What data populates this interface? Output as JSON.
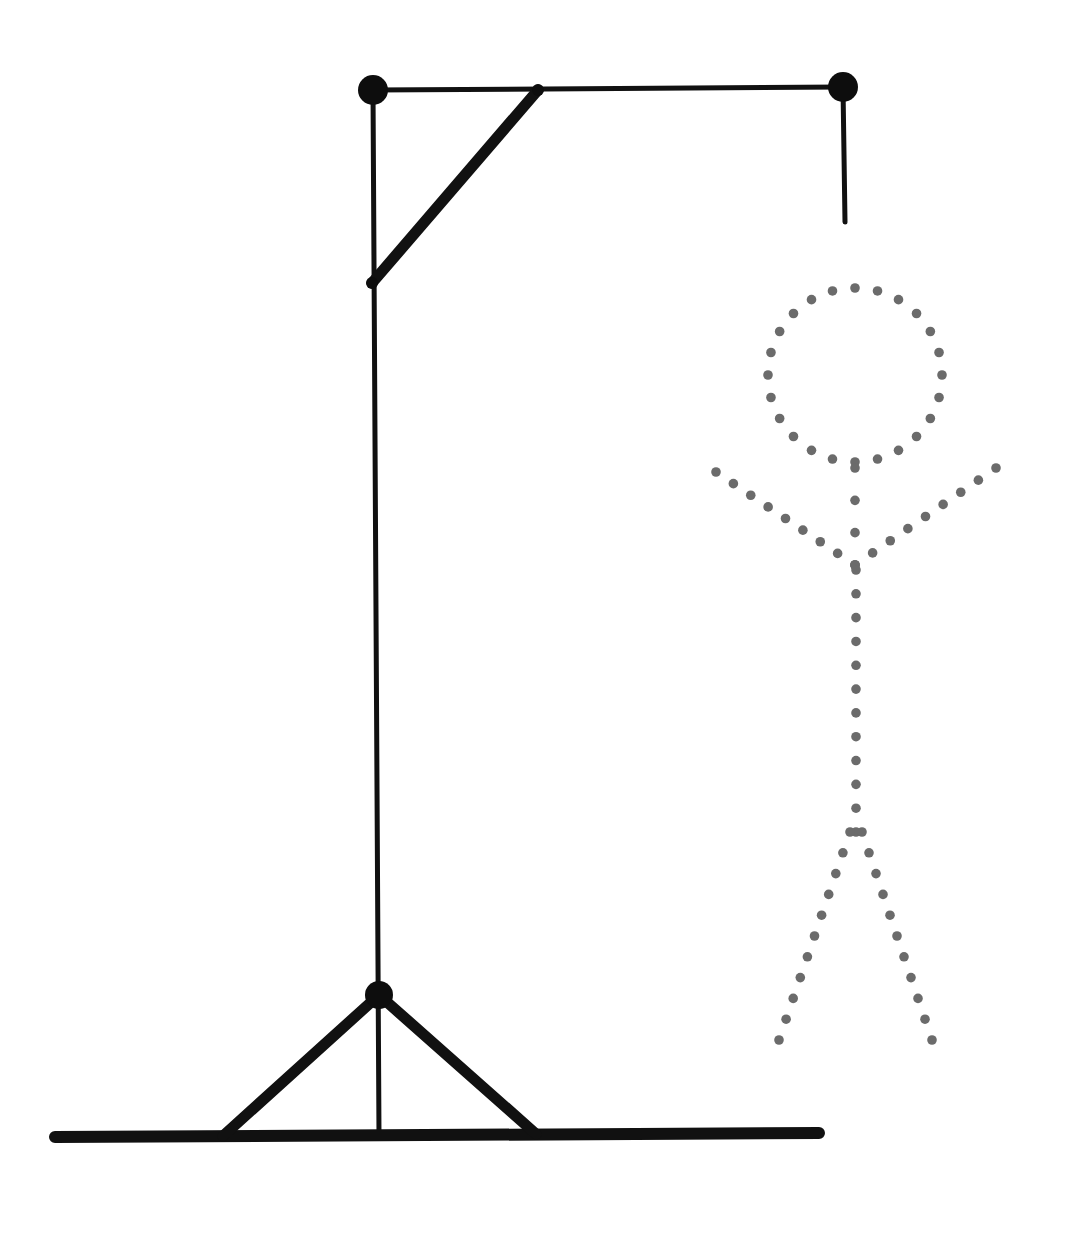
{
  "canvas": {
    "width": 1069,
    "height": 1237,
    "background": "#ffffff",
    "title": "Hangman Gallows With Dotted Stick Figure"
  },
  "palette": {
    "structure_stroke": "#111111",
    "thin_stroke": "#1a1a1a",
    "node_fill": "#0d0d0d",
    "dot_fill": "#6b6b6b"
  },
  "strokes": {
    "beam_thin": 5,
    "post_thin": 5,
    "brace_thick": 11,
    "ground_thick": 12,
    "rope_thin": 5
  },
  "gallows": {
    "name": "gallows-structure",
    "nodes": [
      {
        "name": "top-left-node",
        "cx": 373,
        "cy": 90,
        "r": 15
      },
      {
        "name": "top-right-node",
        "cx": 843,
        "cy": 87,
        "r": 15
      },
      {
        "name": "base-node",
        "cx": 379,
        "cy": 995,
        "r": 14
      },
      {
        "name": "brace-lower-joint",
        "cx": 372,
        "cy": 283,
        "r": 6
      },
      {
        "name": "brace-upper-joint",
        "cx": 538,
        "cy": 90,
        "r": 6
      }
    ],
    "members": [
      {
        "name": "top-beam",
        "x1": 373,
        "y1": 90,
        "x2": 843,
        "y2": 87,
        "w": 5
      },
      {
        "name": "vertical-post",
        "x1": 373,
        "y1": 90,
        "x2": 379,
        "y2": 1136,
        "w": 5
      },
      {
        "name": "top-diagonal-brace",
        "x1": 538,
        "y1": 90,
        "x2": 372,
        "y2": 283,
        "w": 11
      },
      {
        "name": "ground-line",
        "x1": 55,
        "y1": 1137,
        "x2": 819,
        "y2": 1133,
        "w": 12
      },
      {
        "name": "base-brace-left",
        "x1": 379,
        "y1": 995,
        "x2": 223,
        "y2": 1136,
        "w": 11
      },
      {
        "name": "base-brace-right",
        "x1": 379,
        "y1": 995,
        "x2": 536,
        "y2": 1134,
        "w": 11
      },
      {
        "name": "hanging-rope",
        "x1": 843,
        "y1": 87,
        "x2": 845,
        "y2": 222,
        "w": 5
      }
    ]
  },
  "stick_figure": {
    "name": "dotted-stick-figure",
    "dot_radius": 4.8,
    "head": {
      "name": "figure-head",
      "cx": 855,
      "cy": 375,
      "r": 87,
      "dot_count": 24,
      "start_angle_deg": -90
    },
    "limbs": [
      {
        "name": "figure-neck",
        "x1": 855,
        "y1": 468,
        "x2": 855,
        "y2": 565,
        "dots": 4
      },
      {
        "name": "figure-arm-left",
        "x1": 855,
        "y1": 565,
        "x2": 716,
        "y2": 472,
        "dots": 9
      },
      {
        "name": "figure-arm-right",
        "x1": 855,
        "y1": 565,
        "x2": 996,
        "y2": 468,
        "dots": 9
      },
      {
        "name": "figure-torso",
        "x1": 856,
        "y1": 570,
        "x2": 856,
        "y2": 832,
        "dots": 12
      },
      {
        "name": "figure-leg-left",
        "x1": 850,
        "y1": 832,
        "x2": 779,
        "y2": 1040,
        "dots": 11
      },
      {
        "name": "figure-leg-right",
        "x1": 862,
        "y1": 832,
        "x2": 932,
        "y2": 1040,
        "dots": 11
      }
    ]
  },
  "legend": {
    "structure_label": "gallows",
    "figure_label": "dotted outline figure"
  }
}
